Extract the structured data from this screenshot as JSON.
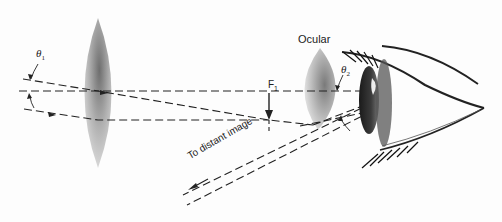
{
  "diagram": {
    "type": "optical-ray-diagram",
    "labels": {
      "ocular": "Ocular",
      "focal_point": "F",
      "focal_point_sub": "1",
      "theta1": "θ",
      "theta1_sub": "1",
      "theta2": "θ",
      "theta2_sub": "2",
      "distant_image": "To distant image"
    },
    "elements": [
      {
        "name": "objective-lens",
        "shape": "biconvex",
        "center_x": 98,
        "top_y": 18,
        "bottom_y": 168
      },
      {
        "name": "ocular-lens",
        "shape": "biconvex",
        "center_x": 320,
        "top_y": 48,
        "bottom_y": 130
      },
      {
        "name": "eye",
        "position": "right"
      },
      {
        "name": "intermediate-image-arrow",
        "at": "F1",
        "x": 269
      }
    ],
    "colors": {
      "ink": "#222222",
      "lens_dark": "#6e6e6e",
      "lens_light": "#e4e4e4",
      "background": "#fdfdfd"
    }
  }
}
